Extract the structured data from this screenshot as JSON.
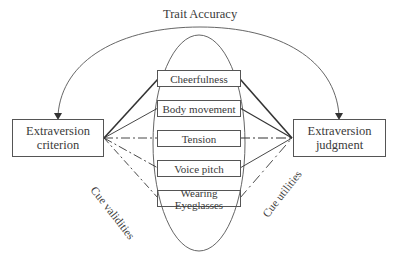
{
  "diagram": {
    "title_arc_label": "Trait Accuracy",
    "left_node": {
      "line1": "Extraversion",
      "line2": "criterion"
    },
    "right_node": {
      "line1": "Extraversion",
      "line2": "judgment"
    },
    "cues": [
      {
        "label": "Cheerfulness",
        "validity_line": "solid-thick",
        "utility_line": "solid-thick"
      },
      {
        "label": "Body movement",
        "validity_line": "solid",
        "utility_line": "solid"
      },
      {
        "label": "Tension",
        "validity_line": "dash-dot",
        "utility_line": "dash-dot"
      },
      {
        "label": "Voice pitch",
        "validity_line": "dash-dot",
        "utility_line": "solid"
      },
      {
        "label": "Wearing Eyeglasses",
        "validity_line": "dash-dot",
        "utility_line": "dash-dot"
      }
    ],
    "left_edge_label": "Cue validities",
    "right_edge_label": "Cue utilities",
    "colors": {
      "stroke": "#444444",
      "text": "#3a3a3a",
      "background": "#ffffff"
    }
  }
}
